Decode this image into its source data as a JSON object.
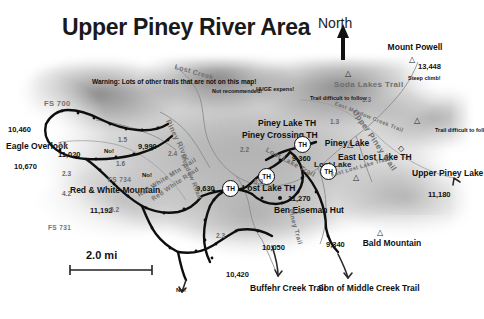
{
  "map": {
    "title": "Upper Piney River Area",
    "north_label": "North",
    "scale_label": "2.0 mi",
    "warning": "Warning: Lots of other trails that are not on this map!",
    "notes": [
      {
        "id": "not-recommended",
        "text": "Not recommended!"
      },
      {
        "id": "huge-expens",
        "text": "HUGE expens!"
      },
      {
        "id": "steep-climb",
        "text": "Steep climb!"
      },
      {
        "id": "trail-difficult-nw",
        "text": "Trail difficult to follow"
      },
      {
        "id": "trail-difficult-e",
        "text": "Trail difficult to follow"
      }
    ],
    "places": [
      {
        "name": "Mount Powell",
        "elevation": "13,448",
        "type": "peak"
      },
      {
        "name": "Eagle Overlook",
        "elevation": "10,670",
        "type": "overlook"
      },
      {
        "name": "Red & White Mountain",
        "elevation": "11,192",
        "type": "peak"
      },
      {
        "name": "Bald Mountain",
        "elevation": "",
        "type": "peak"
      },
      {
        "name": "Piney Lake",
        "elevation": "",
        "type": "lake"
      },
      {
        "name": "Lost Lake",
        "elevation": "",
        "type": "lake"
      },
      {
        "name": "Upper Piney Lake",
        "elevation": "11,180",
        "type": "lake"
      },
      {
        "name": "Ben Eiseman Hut",
        "elevation": "11,270",
        "type": "hut"
      }
    ],
    "trailheads": [
      {
        "name": "Piney Crossing TH",
        "marker": "TH"
      },
      {
        "name": "Piney Lake TH",
        "marker": "TH",
        "elevation": "9,360"
      },
      {
        "name": "East Lost Lake TH",
        "marker": "TH"
      },
      {
        "name": "Lost Lake TH",
        "marker": "TH",
        "elevation": "9,630"
      }
    ],
    "trail_labels": [
      {
        "text": "Soda Lakes Trail"
      },
      {
        "text": "Upper Piney Trail"
      },
      {
        "text": "Lost Lake Trail"
      },
      {
        "text": "East Lost Lake Trail"
      },
      {
        "text": "East Meadow Creek Trail"
      },
      {
        "text": "Red White Mtn Trail"
      },
      {
        "text": "Piney Trail"
      },
      {
        "text": "Lost Lake Trail"
      }
    ],
    "road_labels": [
      {
        "text": "FS 700"
      },
      {
        "text": "FS 731"
      },
      {
        "text": "FS 734"
      },
      {
        "text": "Piney River"
      },
      {
        "text": "Lost Creek"
      },
      {
        "text": "Meadow Road"
      },
      {
        "text": "Red White Road"
      }
    ],
    "elevations": [
      {
        "value": "10,460"
      },
      {
        "value": "10,670"
      },
      {
        "value": "11,020"
      },
      {
        "value": "9,990"
      },
      {
        "value": "11,192"
      },
      {
        "value": "9,630"
      },
      {
        "value": "9,360"
      },
      {
        "value": "10,050"
      },
      {
        "value": "9,340"
      },
      {
        "value": "10,420"
      },
      {
        "value": "11,270"
      },
      {
        "value": "11,180"
      },
      {
        "value": "13,448"
      }
    ],
    "mileages": [
      "2.1",
      "1.5",
      "2.3",
      "2.4",
      "1.6",
      "3.3",
      "2.2",
      "1.4",
      "4.2",
      "0.9",
      "2.3",
      "5.2",
      "1.3"
    ],
    "no_markers": [
      {
        "text": "No!"
      },
      {
        "text": "No!"
      },
      {
        "text": "No!"
      }
    ],
    "exit_trails": [
      {
        "name": "Buffehr Creek Trail"
      },
      {
        "name": "Son of Middle Creek Trail"
      }
    ],
    "colors": {
      "title": "#1a1a1a",
      "trail": "#111111",
      "road": "#6a6a6a",
      "terrain_light": "#b9b9b9",
      "terrain_dark": "#4a4a4a"
    }
  }
}
